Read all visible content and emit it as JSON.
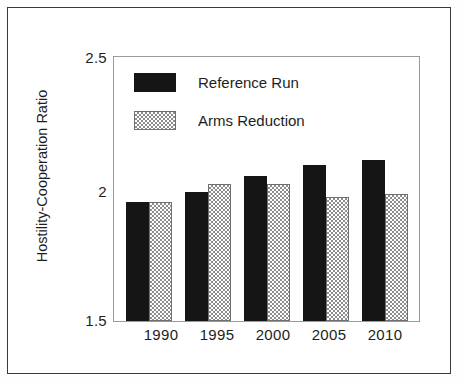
{
  "chart_data": {
    "type": "bar",
    "title": "",
    "subtitle": "",
    "xlabel": "",
    "ylabel": "Hostility-Cooperation Ratio",
    "categories": [
      "1990",
      "1995",
      "2000",
      "2005",
      "2010"
    ],
    "series": [
      {
        "name": "Reference Run",
        "color": "#151515",
        "pattern": "solid",
        "values": [
          1.95,
          1.99,
          2.05,
          2.09,
          2.11
        ]
      },
      {
        "name": "Arms Reduction",
        "color": "#8d8d8d",
        "pattern": "checkered",
        "values": [
          1.95,
          2.02,
          2.02,
          1.97,
          1.98
        ]
      }
    ],
    "ylim": [
      1.5,
      2.5
    ],
    "yticks": [
      1.5,
      2.0,
      2.5
    ],
    "ytick_labels": [
      "1.5",
      "2",
      "2.5"
    ],
    "grid": false,
    "legend_position": "top-left-inside",
    "frame": true
  },
  "legend": {
    "entries": [
      {
        "label": "Reference Run",
        "swatch": "solid-black-swatch"
      },
      {
        "label": "Arms Reduction",
        "swatch": "checkered-gray-swatch"
      }
    ]
  },
  "axes": {
    "y_title": "Hostility-Cooperation Ratio",
    "y_labels": [
      "2.5",
      "2",
      "1.5"
    ],
    "x_labels": [
      "1990",
      "1995",
      "2000",
      "2005",
      "2010"
    ]
  }
}
